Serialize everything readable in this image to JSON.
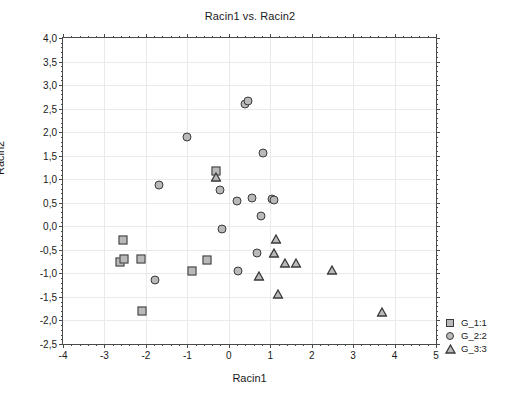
{
  "chart_data": {
    "type": "scatter",
    "title": "Racin1 vs. Racin2",
    "xlabel": "Racin1",
    "ylabel": "Racin2",
    "xlim": [
      -4,
      5
    ],
    "ylim": [
      -2.5,
      4.0
    ],
    "xticks": [
      "-4",
      "-3",
      "-2",
      "-1",
      "0",
      "1",
      "2",
      "3",
      "4",
      "5"
    ],
    "xtick_values": [
      -4,
      -3,
      -2,
      -1,
      0,
      1,
      2,
      3,
      4,
      5
    ],
    "yticks": [
      "4,0",
      "3,5",
      "3,0",
      "2,5",
      "2,0",
      "1,5",
      "1,0",
      "0,5",
      "0,0",
      "-0,5",
      "-1,0",
      "-1,5",
      "-2,0",
      "-2,5"
    ],
    "ytick_values": [
      4.0,
      3.5,
      3.0,
      2.5,
      2.0,
      1.5,
      1.0,
      0.5,
      0.0,
      -0.5,
      -1.0,
      -1.5,
      -2.0,
      -2.5
    ],
    "grid": true,
    "legend_position": "right-bottom-outside",
    "marker_fill": "#b9b9b9",
    "marker_edge": "#3a3a3a",
    "series": [
      {
        "name": "G_1:1",
        "marker": "square",
        "points": [
          [
            -2.55,
            -0.3
          ],
          [
            -2.62,
            -0.76
          ],
          [
            -2.53,
            -0.69
          ],
          [
            -2.12,
            -0.7
          ],
          [
            -2.1,
            -1.8
          ],
          [
            -0.89,
            -0.95
          ],
          [
            -0.52,
            -0.72
          ],
          [
            -0.3,
            1.18
          ]
        ]
      },
      {
        "name": "G_2:2",
        "marker": "circle",
        "points": [
          [
            -1.68,
            0.87
          ],
          [
            -1.77,
            -1.13
          ],
          [
            -1.01,
            1.89
          ],
          [
            -0.22,
            0.78
          ],
          [
            -0.17,
            -0.06
          ],
          [
            0.2,
            0.54
          ],
          [
            0.23,
            -0.94
          ],
          [
            0.4,
            2.6
          ],
          [
            0.47,
            2.67
          ],
          [
            0.55,
            0.61
          ],
          [
            0.68,
            -0.57
          ],
          [
            0.78,
            0.22
          ],
          [
            0.83,
            1.56
          ],
          [
            1.05,
            0.58
          ],
          [
            1.1,
            0.55
          ]
        ]
      },
      {
        "name": "G_3:3",
        "marker": "triangle",
        "points": [
          [
            -0.3,
            1.04
          ],
          [
            0.72,
            -1.05
          ],
          [
            1.13,
            -0.26
          ],
          [
            1.1,
            -0.57
          ],
          [
            1.18,
            -1.44
          ],
          [
            1.35,
            -0.78
          ],
          [
            1.62,
            -0.78
          ],
          [
            2.5,
            -0.92
          ],
          [
            3.7,
            -1.82
          ]
        ]
      }
    ]
  },
  "legend": {
    "items": [
      {
        "label": "G_1:1",
        "marker": "square"
      },
      {
        "label": "G_2:2",
        "marker": "circle"
      },
      {
        "label": "G_3:3",
        "marker": "triangle"
      }
    ]
  }
}
